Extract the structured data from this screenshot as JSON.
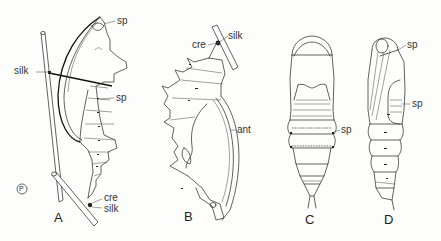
{
  "figure": {
    "panels": [
      {
        "id": "A",
        "label": "A",
        "annotations": [
          {
            "text": "sp",
            "target": "spiracle (upper)"
          },
          {
            "text": "silk",
            "target": "silk girdle"
          },
          {
            "text": "sp",
            "target": "spiracle (abdominal)"
          },
          {
            "text": "cre",
            "target": "cremaster"
          },
          {
            "text": "silk",
            "target": "silk pad"
          }
        ]
      },
      {
        "id": "B",
        "label": "B",
        "annotations": [
          {
            "text": "cre",
            "target": "cremaster"
          },
          {
            "text": "silk",
            "target": "silk pad"
          },
          {
            "text": "ant",
            "target": "antenna"
          }
        ]
      },
      {
        "id": "C",
        "label": "C",
        "annotations": [
          {
            "text": "sp",
            "target": "spiracle"
          }
        ]
      },
      {
        "id": "D",
        "label": "D",
        "annotations": [
          {
            "text": "sp",
            "target": "spiracle (upper)"
          },
          {
            "text": "sp",
            "target": "spiracle (abdominal)"
          }
        ]
      }
    ],
    "copyright_mark": "P"
  }
}
